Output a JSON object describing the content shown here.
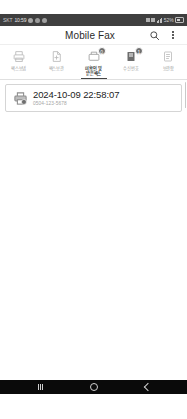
{
  "status_bar": {
    "carrier": "SKT",
    "time": "10:59",
    "battery_percent": "52%",
    "icons": [
      "sync-icon",
      "cloud-icon",
      "notification-icon",
      "wifi-icon",
      "signal-icon",
      "battery-icon"
    ]
  },
  "app_bar": {
    "title": "Mobile Fax",
    "search_icon": "search-icon",
    "overflow_icon": "kebab-menu-icon"
  },
  "toolbar": {
    "items": [
      {
        "label": "팩스보냄",
        "icon": "fax-send-icon",
        "badge": "",
        "selected": false
      },
      {
        "label": "팩스보관",
        "icon": "fax-folder-icon",
        "badge": "",
        "selected": false
      },
      {
        "label": "미확인 및\n받은팩스",
        "icon": "fax-received-icon",
        "badge": "0",
        "selected": true
      },
      {
        "label": "수신번호",
        "icon": "fax-inbox-icon",
        "badge": "1",
        "selected": false
      },
      {
        "label": "보관함",
        "icon": "fax-archive-icon",
        "badge": "",
        "selected": false
      }
    ]
  },
  "fax_list": {
    "items": [
      {
        "date": "2024-10-09 22:58:07",
        "number": "0504-123-5678",
        "icon": "fax-document-icon"
      }
    ]
  },
  "nav_bar": {
    "recents_label": "recents-button",
    "home_label": "home-button",
    "back_label": "back-button"
  },
  "colors": {
    "status_bar_bg": "#3f3f3f",
    "accent_badge": "#6e6e6e",
    "text_primary": "#1d1d1d",
    "text_secondary": "#a5a5a5",
    "nav_bar_bg": "#0a0a0a"
  }
}
